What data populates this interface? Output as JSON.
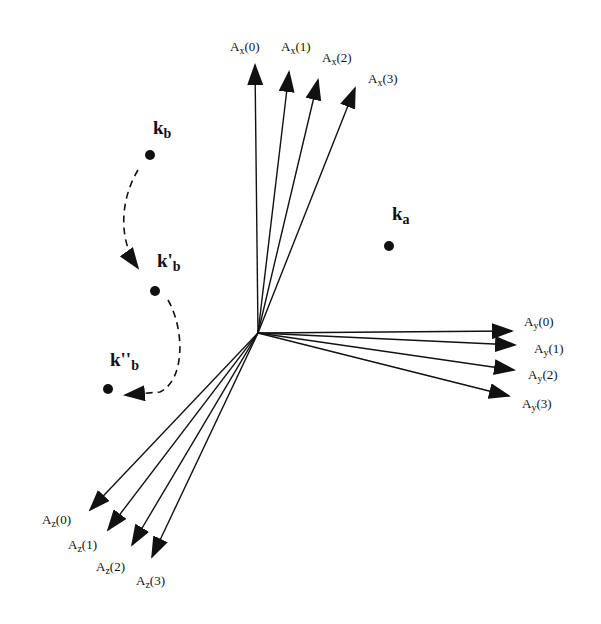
{
  "origin": {
    "x": 258,
    "y": 333
  },
  "vectors": {
    "x": [
      {
        "base": "A",
        "sub": "x",
        "idx": "(0)",
        "tip": [
          255,
          65
        ],
        "label": [
          230,
          40
        ]
      },
      {
        "base": "A",
        "sub": "x",
        "idx": "(1)",
        "tip": [
          289,
          72
        ],
        "label": [
          281,
          40
        ]
      },
      {
        "base": "A",
        "sub": "x",
        "idx": "(2)",
        "tip": [
          318,
          80
        ],
        "label": [
          322,
          51
        ]
      },
      {
        "base": "A",
        "sub": "x",
        "idx": "(3)",
        "tip": [
          355,
          88
        ],
        "label": [
          368,
          72
        ]
      }
    ],
    "y": [
      {
        "base": "A",
        "sub": "y",
        "idx": "(0)",
        "tip": [
          512,
          331
        ],
        "label": [
          524,
          315
        ]
      },
      {
        "base": "A",
        "sub": "y",
        "idx": "(1)",
        "tip": [
          515,
          345
        ],
        "label": [
          534,
          342
        ]
      },
      {
        "base": "A",
        "sub": "y",
        "idx": "(2)",
        "tip": [
          514,
          370
        ],
        "label": [
          528,
          368
        ]
      },
      {
        "base": "A",
        "sub": "y",
        "idx": "(3)",
        "tip": [
          509,
          396
        ],
        "label": [
          522,
          397
        ]
      }
    ],
    "z": [
      {
        "base": "A",
        "sub": "z",
        "idx": "(0)",
        "tip": [
          90,
          510
        ],
        "label": [
          42,
          513
        ]
      },
      {
        "base": "A",
        "sub": "z",
        "idx": "(1)",
        "tip": [
          108,
          530
        ],
        "label": [
          68,
          538
        ]
      },
      {
        "base": "A",
        "sub": "z",
        "idx": "(2)",
        "tip": [
          132,
          545
        ],
        "label": [
          96,
          560
        ]
      },
      {
        "base": "A",
        "sub": "z",
        "idx": "(3)",
        "tip": [
          152,
          557
        ],
        "label": [
          136,
          574
        ]
      }
    ]
  },
  "points": [
    {
      "id": "ka",
      "base": "k",
      "sub": "a",
      "x": 389,
      "y": 246,
      "label": [
        392,
        204
      ]
    },
    {
      "id": "kb",
      "base": "k",
      "sub": "b",
      "x": 150,
      "y": 155,
      "label": [
        153,
        118
      ]
    },
    {
      "id": "kpb",
      "base": "k'",
      "sub": "b",
      "x": 155,
      "y": 291,
      "label": [
        157,
        251
      ]
    },
    {
      "id": "kppb",
      "base": "k''",
      "sub": "b",
      "x": 108,
      "y": 389,
      "label": [
        110,
        350
      ]
    }
  ],
  "trajectory": {
    "path1": "M 138 170 C 120 200, 118 240, 138 268",
    "path2": "M 168 300 C 185 330, 185 380, 160 392 L 125 395"
  },
  "colors": {
    "ink": "#111111",
    "background": "#ffffff"
  }
}
